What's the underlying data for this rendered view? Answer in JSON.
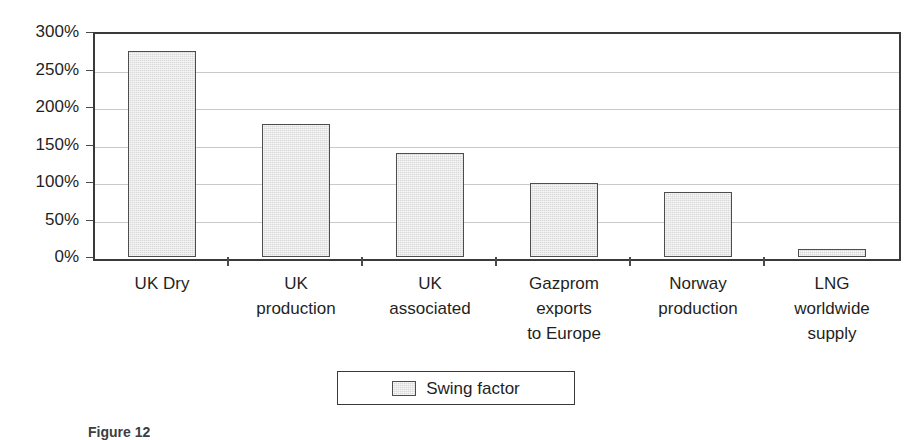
{
  "chart_data": {
    "type": "bar",
    "title": "",
    "xlabel": "",
    "ylabel": "",
    "categories": [
      "UK Dry",
      "UK production",
      "UK associated",
      "Gazprom exports to Europe",
      "Norway production",
      "LNG worldwide supply"
    ],
    "category_lines": [
      [
        "UK Dry"
      ],
      [
        "UK",
        "production"
      ],
      [
        "UK",
        "associated"
      ],
      [
        "Gazprom",
        "exports",
        "to Europe"
      ],
      [
        "Norway",
        "production"
      ],
      [
        "LNG",
        "worldwide",
        "supply"
      ]
    ],
    "series": [
      {
        "name": "Swing factor",
        "values": [
          277,
          179,
          140,
          99,
          88,
          11
        ],
        "unit": "%",
        "color": "#d9d9d9",
        "border_color": "#4d4d4d"
      }
    ],
    "ylim": [
      0,
      300
    ],
    "ytick_values": [
      0,
      50,
      100,
      150,
      200,
      250,
      300
    ],
    "ytick_labels": [
      "0%",
      "50%",
      "100%",
      "150%",
      "200%",
      "250%",
      "300%"
    ],
    "grid": true,
    "grid_axis": "y",
    "legend_position": "bottom-center"
  },
  "legend": {
    "entries": [
      {
        "label": "Swing factor",
        "swatch_color": "#d9d9d9"
      }
    ]
  },
  "caption": {
    "text": "Figure 12"
  },
  "colors": {
    "bar_fill": "#d9d9d9",
    "bar_border": "#4d4d4d",
    "axis": "#3a3a3a",
    "gridline": "#c9c9c9",
    "text": "#1f1f1f",
    "background": "#ffffff"
  }
}
